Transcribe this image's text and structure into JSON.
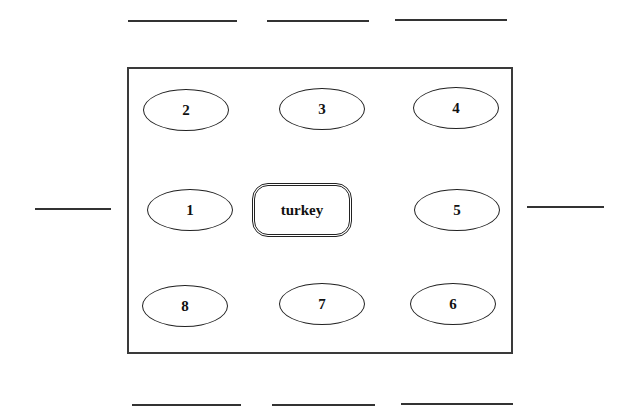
{
  "diagram": {
    "title": "",
    "center_item": {
      "label": "turkey"
    },
    "seats": [
      {
        "number": "1",
        "position": "left-middle"
      },
      {
        "number": "2",
        "position": "top-left"
      },
      {
        "number": "3",
        "position": "top-center"
      },
      {
        "number": "4",
        "position": "top-right"
      },
      {
        "number": "5",
        "position": "right-middle"
      },
      {
        "number": "6",
        "position": "bottom-right"
      },
      {
        "number": "7",
        "position": "bottom-center"
      },
      {
        "number": "8",
        "position": "bottom-left"
      }
    ],
    "name_blanks": {
      "top": [
        "",
        "",
        ""
      ],
      "left": [
        ""
      ],
      "right": [
        ""
      ],
      "bottom": [
        "",
        "",
        ""
      ]
    },
    "colors": {
      "stroke": "#222222",
      "background": "#ffffff"
    }
  }
}
